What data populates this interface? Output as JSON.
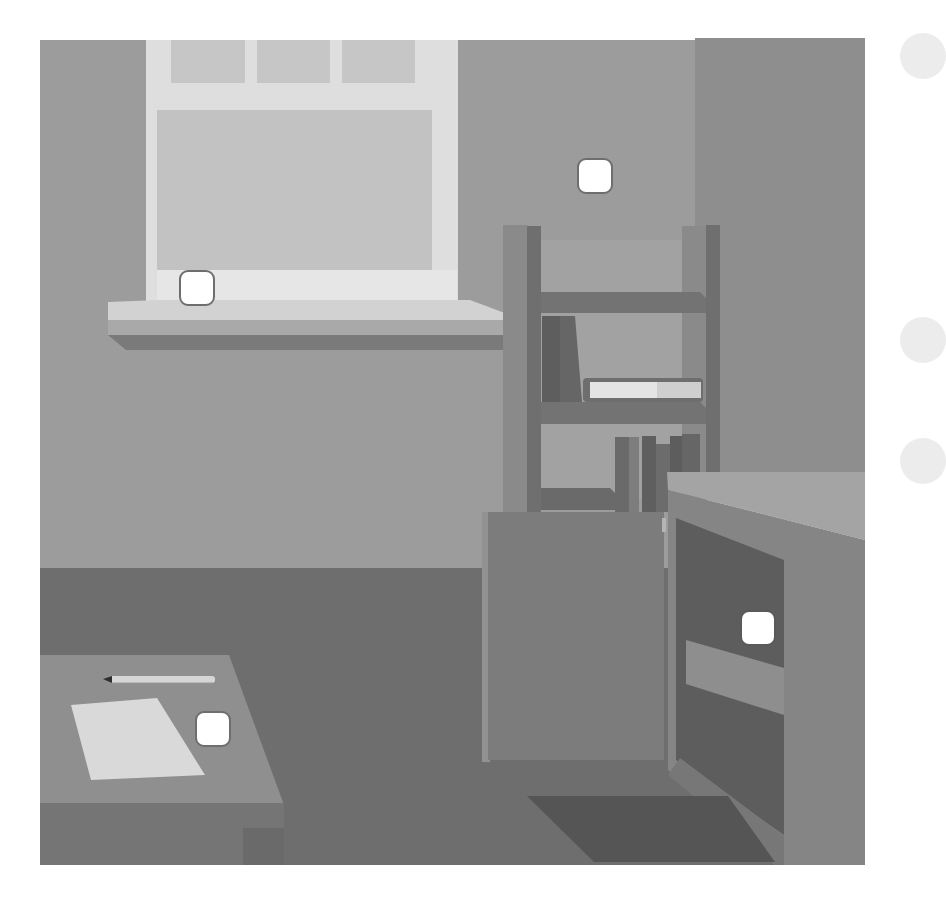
{
  "scene": {
    "title": "Room scene",
    "description": "Grayscale room interior with a window, bookshelf, cabinet, open cupboard and a desk with paper and pencil",
    "colors": {
      "background": "#ffffff",
      "wall_left": "#9c9c9c",
      "wall_right": "#8e8e8e",
      "window_frame": "#dedede",
      "window_pane": "#c2c2c2",
      "sill_top": "#d2d2d2",
      "sill_front": "#a9a9a9",
      "sill_shadow": "#7a7a7a",
      "floor": "#6e6e6e",
      "shelf": "#727272",
      "cabinet": "#7c7c7c",
      "cupboard": "#858585",
      "cupboard_inside": "#5d5d5d",
      "desk_top": "#8f8f8f",
      "desk_front": "#757575",
      "paper": "#d9d9d9",
      "rug": "#555555",
      "hotspot": "#ffffff",
      "hotspot_border": "#6e6e6e",
      "side_button": "#ececec"
    }
  },
  "objects": [
    {
      "name": "window",
      "label": "Window"
    },
    {
      "name": "window-sill",
      "label": "Window sill"
    },
    {
      "name": "bookshelf",
      "label": "Bookshelf"
    },
    {
      "name": "books-upright",
      "label": "Books"
    },
    {
      "name": "book-lying",
      "label": "Book"
    },
    {
      "name": "cabinet",
      "label": "Cabinet"
    },
    {
      "name": "cupboard-open",
      "label": "Open cupboard"
    },
    {
      "name": "desk",
      "label": "Desk"
    },
    {
      "name": "paper",
      "label": "Paper"
    },
    {
      "name": "pencil",
      "label": "Pencil"
    },
    {
      "name": "rug",
      "label": "Rug"
    }
  ],
  "hotspots": [
    {
      "id": "window-sill-hotspot",
      "target": "Window sill",
      "x": 179,
      "y": 270
    },
    {
      "id": "wall-hotspot",
      "target": "Wall",
      "x": 577,
      "y": 158
    },
    {
      "id": "cupboard-hotspot",
      "target": "Open cupboard",
      "x": 740,
      "y": 610
    },
    {
      "id": "desk-hotspot",
      "target": "Desk",
      "x": 195,
      "y": 711
    }
  ],
  "side_buttons": [
    {
      "id": "side-button-1",
      "y": 33
    },
    {
      "id": "side-button-2",
      "y": 317
    },
    {
      "id": "side-button-3",
      "y": 438
    }
  ]
}
